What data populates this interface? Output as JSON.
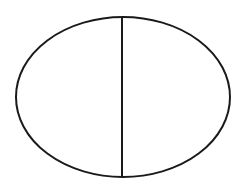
{
  "canvas": {
    "width": 236,
    "height": 183,
    "background_color": "#ffffff"
  },
  "figure": {
    "title": "Ellipse divided by a vertical line",
    "stroke_color": "#1a1a1a",
    "fill_color": "#ffffff",
    "shapes": {
      "ellipse": {
        "name": "ellipse-outline",
        "center_x": 123,
        "center_y": 97,
        "radius_x": 107,
        "radius_y": 80,
        "stroke_width": 2,
        "left_x": 16,
        "right_x": 230,
        "top_y": 17,
        "bottom_y": 177
      },
      "vertical_line": {
        "name": "vertical-divider",
        "x": 122,
        "y_start": 17,
        "y_end": 177,
        "stroke_width": 2
      }
    }
  }
}
